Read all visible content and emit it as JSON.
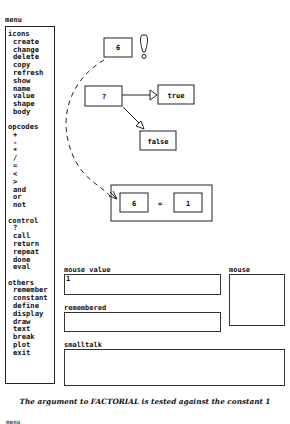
{
  "menu": {
    "title": "menu",
    "groups": [
      {
        "title": "icons",
        "items": [
          "create",
          "change",
          "delete",
          "copy",
          "refresh",
          "show",
          "name",
          "value",
          "shape",
          "body"
        ]
      },
      {
        "title": "opcodes",
        "items": [
          "+",
          "-",
          "*",
          "/",
          "=",
          "<",
          ">",
          "and",
          "or",
          "not"
        ]
      },
      {
        "title": "control",
        "items": [
          "?",
          "call",
          "return",
          "repeat",
          "done",
          "eval"
        ]
      },
      {
        "title": "others",
        "items": [
          "remember",
          "constant",
          "define",
          "display",
          "draw",
          "text",
          "break",
          "plot",
          "exit"
        ]
      }
    ]
  },
  "diagram": {
    "top_node": "6",
    "alert_icon": "exclamation-icon",
    "test_node": "?",
    "true_node": "true",
    "false_node": "false",
    "compare_left": "6",
    "compare_op": "=",
    "compare_right": "1"
  },
  "panels": {
    "mouse_value_label": "mouse value",
    "mouse_value": "1",
    "mouse_label": "mouse",
    "remembered_label": "remembered",
    "remembered_value": "",
    "smalltalk_label": "smalltalk",
    "smalltalk_value": ""
  },
  "caption": "The argument to FACTORIAL is tested against the constant 1",
  "next_menu_title": "menu"
}
